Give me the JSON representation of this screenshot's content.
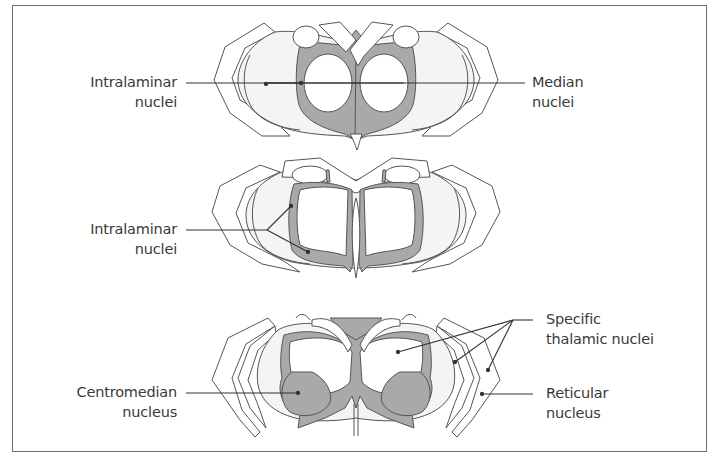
{
  "figure": {
    "colors": {
      "shaded_nuclei": "#a9a9a9",
      "outline": "#555555",
      "light_fill": "#f4f4f4",
      "frame": "#6e6e6e",
      "label_text": "#3a3a3a"
    },
    "sections": [
      {
        "name": "top-section",
        "labels": {
          "left": {
            "line1": "Intralaminar",
            "line2": "nuclei"
          },
          "right": {
            "line1": "Median",
            "line2": "nuclei"
          }
        }
      },
      {
        "name": "middle-section",
        "labels": {
          "left": {
            "line1": "Intralaminar",
            "line2": "nuclei"
          }
        }
      },
      {
        "name": "bottom-section",
        "labels": {
          "left": {
            "line1": "Centromedian",
            "line2": "nucleus"
          },
          "right_top": {
            "line1": "Specific",
            "line2": "thalamic nuclei"
          },
          "right_bottom": {
            "line1": "Reticular",
            "line2": "nucleus"
          }
        }
      }
    ]
  }
}
